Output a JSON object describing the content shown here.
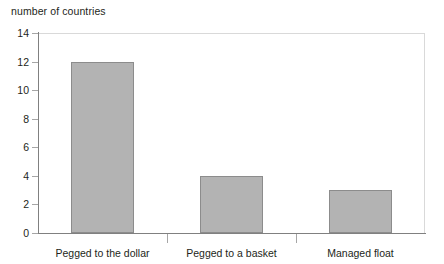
{
  "chart_data": {
    "type": "bar",
    "title": "number of countries",
    "xlabel": "",
    "ylabel": "number of countries",
    "categories": [
      "Pegged to the dollar",
      "Pegged to a basket",
      "Managed float"
    ],
    "values": [
      12,
      4,
      3
    ],
    "ylim": [
      0,
      14
    ],
    "yticks": [
      0,
      2,
      4,
      6,
      8,
      10,
      12,
      14
    ],
    "ytick_labels": [
      "0",
      "2",
      "4",
      "6",
      "8",
      "10",
      "12",
      "14"
    ],
    "grid": false,
    "legend": null,
    "bar_color": "#b3b3b3",
    "bar_edge_color": "#8c8c8c",
    "axis_color": "#808080",
    "text_color": "#231f20"
  }
}
